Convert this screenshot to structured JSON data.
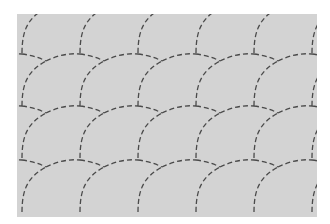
{
  "pattern": {
    "name": "fish-scale",
    "background_color": "#d3d3d3",
    "page_color": "#ffffff",
    "line_color": "#4a4a4a",
    "column_x": [
      -36,
      22,
      80,
      138,
      196,
      254,
      312
    ],
    "row_bottoms": [
      53,
      106,
      158,
      212
    ],
    "row_height": 52
  }
}
